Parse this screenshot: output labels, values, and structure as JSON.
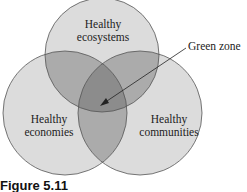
{
  "diagram": {
    "type": "venn",
    "circles": [
      {
        "id": "ecosystems",
        "label_line1": "Healthy",
        "label_line2": "ecosystems"
      },
      {
        "id": "economies",
        "label_line1": "Healthy",
        "label_line2": "economies"
      },
      {
        "id": "communities",
        "label_line1": "Healthy",
        "label_line2": "communities"
      }
    ],
    "annotation": {
      "label": "Green zone",
      "points_to": "intersection of all three circles"
    },
    "caption": "Figure 5.11",
    "colors": {
      "fill": "#d9d9d9",
      "stroke": "#555555",
      "pair_overlap": "#a8a8a8",
      "triple_overlap": "#8a8a8a"
    }
  }
}
